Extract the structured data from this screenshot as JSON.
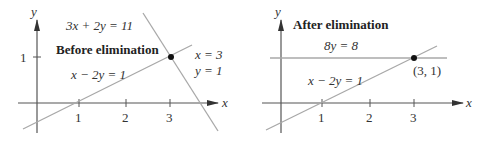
{
  "left_panel": {
    "title": "Before elimination",
    "axis_x_label": "x",
    "axis_y_label": "y",
    "x_ticks": [
      "1",
      "2",
      "3"
    ],
    "y_ticks": [
      "1"
    ],
    "line1_label": "3x + 2y = 11",
    "line2_label": "x − 2y = 1",
    "solution_x": "x = 3",
    "solution_y": "y = 1"
  },
  "right_panel": {
    "title": "After elimination",
    "axis_x_label": "x",
    "axis_y_label": "y",
    "x_ticks": [
      "1",
      "2",
      "3"
    ],
    "line1_label": "8y = 8",
    "line2_label": "x − 2y = 1",
    "point_label": "(3, 1)"
  },
  "colors": {
    "axis": "#555555",
    "line": "#a8a8a8",
    "point": "#111111",
    "text": "#333333"
  }
}
